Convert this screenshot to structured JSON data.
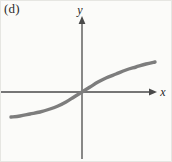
{
  "figure": {
    "panel_label": "(d)",
    "background_color": "#fbfbf9",
    "border_color": "#e6e6e2",
    "width": 172,
    "height": 162
  },
  "axes": {
    "x_label": "x",
    "y_label": "y",
    "axis_color": "#4a4a4a",
    "origin": {
      "x": 82,
      "y": 92
    },
    "x_axis": {
      "start_x": 0,
      "end_x": 157,
      "y": 92
    },
    "y_axis": {
      "x": 82,
      "top_y": 16,
      "bottom_y": 159
    }
  },
  "curve": {
    "color": "#7d7d7d",
    "width": 3.4,
    "description": "increasing sigmoid passing through origin"
  },
  "chart_data": {
    "type": "line",
    "title": "(d)",
    "xlabel": "x",
    "ylabel": "y",
    "grid": false,
    "legend": null,
    "axis_arrows": {
      "x_positive": true,
      "y_positive": true
    },
    "xlim": [
      -4.0,
      4.0
    ],
    "ylim": [
      -1.6,
      1.6
    ],
    "series": [
      {
        "name": "sigmoid",
        "x": [
          -4.0,
          -3.5,
          -3.0,
          -2.5,
          -2.0,
          -1.5,
          -1.0,
          -0.5,
          0.0,
          0.5,
          1.0,
          1.5,
          2.0,
          2.5,
          3.0,
          3.5,
          4.0
        ],
        "y": [
          -1.02,
          -0.99,
          -0.95,
          -0.89,
          -0.81,
          -0.69,
          -0.53,
          -0.3,
          0.0,
          0.3,
          0.53,
          0.69,
          0.81,
          0.89,
          0.95,
          0.99,
          1.02
        ]
      }
    ],
    "pixel_points": [
      [
        11,
        117
      ],
      [
        20,
        116
      ],
      [
        30,
        114
      ],
      [
        40,
        112
      ],
      [
        50,
        109
      ],
      [
        58,
        106
      ],
      [
        66,
        102
      ],
      [
        74,
        97
      ],
      [
        82,
        92
      ],
      [
        90,
        87
      ],
      [
        98,
        82
      ],
      [
        106,
        78
      ],
      [
        116,
        74
      ],
      [
        126,
        70
      ],
      [
        136,
        67
      ],
      [
        146,
        64
      ],
      [
        155,
        62
      ]
    ]
  }
}
